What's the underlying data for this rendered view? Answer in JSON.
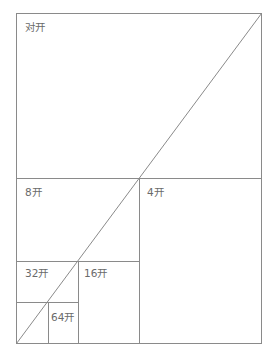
{
  "diagram": {
    "line_color": "#8a8a8a",
    "text_color": "#6a6a6a",
    "regions": [
      {
        "id": "duikai",
        "label": "对开"
      },
      {
        "id": "kai4",
        "label": "4开"
      },
      {
        "id": "kai8",
        "label": "8开"
      },
      {
        "id": "kai16",
        "label": "16开"
      },
      {
        "id": "kai32",
        "label": "32开"
      },
      {
        "id": "kai64",
        "label": "64开"
      }
    ]
  }
}
